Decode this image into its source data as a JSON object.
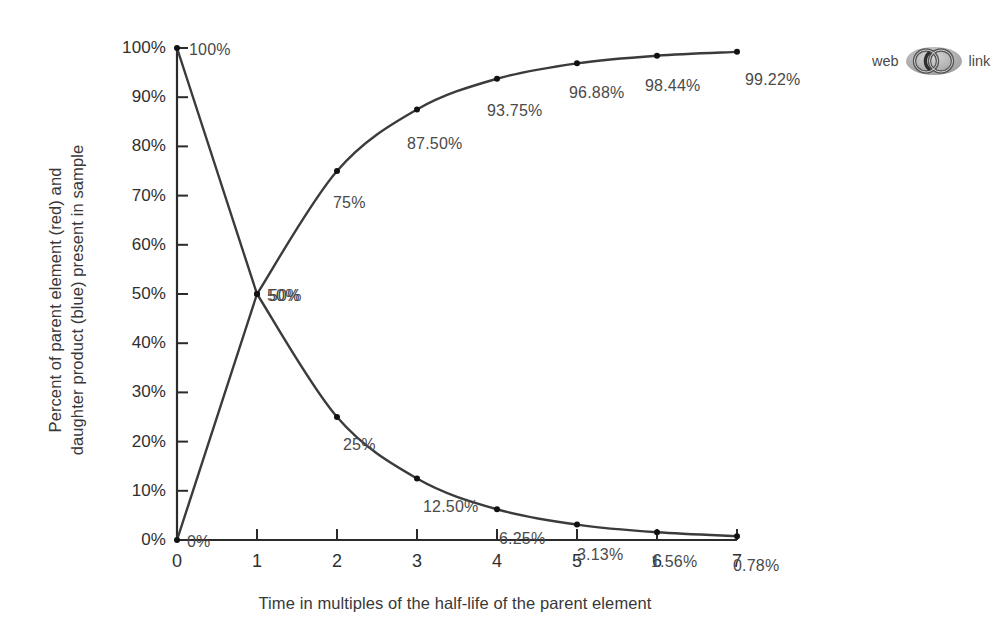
{
  "chart_data": {
    "type": "line",
    "title": "",
    "xlabel": "Time in multiples of the half-life of the parent element",
    "ylabel_line1": "Percent of parent element (red) and",
    "ylabel_line2": "daughter product (blue) present in sample",
    "x": [
      0,
      1,
      2,
      3,
      4,
      5,
      6,
      7
    ],
    "xlim": [
      0,
      7
    ],
    "ylim": [
      0,
      100
    ],
    "grid": false,
    "legend_position": "none",
    "xtick_labels": [
      "0",
      "1",
      "2",
      "3",
      "4",
      "5",
      "6",
      "7"
    ],
    "ytick_labels": [
      "0%",
      "10%",
      "20%",
      "30%",
      "40%",
      "50%",
      "60%",
      "70%",
      "80%",
      "90%",
      "100%"
    ],
    "ytick_values": [
      0,
      10,
      20,
      30,
      40,
      50,
      60,
      70,
      80,
      90,
      100
    ],
    "series": [
      {
        "name": "parent element",
        "color": "#3b3b3b",
        "values": [
          100,
          50,
          25,
          12.5,
          6.25,
          3.13,
          1.56,
          0.78
        ],
        "point_labels": [
          "100%",
          "50%",
          "25%",
          "12.50%",
          "6.25%",
          "3.13%",
          "1.56%",
          "0.78%"
        ]
      },
      {
        "name": "daughter product",
        "color": "#3b3b3b",
        "values": [
          0,
          50,
          75,
          87.5,
          93.75,
          96.88,
          98.44,
          99.22
        ],
        "point_labels": [
          "0%",
          "50%",
          "75%",
          "87.50%",
          "93.75%",
          "96.88%",
          "98.44%",
          "99.22%"
        ]
      }
    ]
  },
  "badge": {
    "prefix": "web",
    "suffix": "link",
    "icon": "interlocking-rings-icon",
    "color": "#8d8d8d"
  }
}
